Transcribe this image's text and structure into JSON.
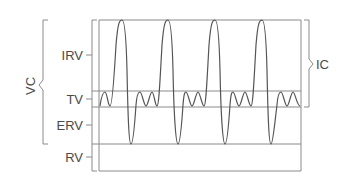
{
  "diagram": {
    "type": "lung-volumes-spirogram",
    "labels": {
      "vc": "VC",
      "ic": "IC",
      "irv": "IRV",
      "tv": "TV",
      "erv": "ERV",
      "rv": "RV"
    },
    "levels_y": {
      "top": 20,
      "tv_top": 91,
      "frc": 107,
      "rv_top": 144,
      "bottom": 171
    },
    "colors": {
      "line": "#8a8a8a",
      "wave": "#555555",
      "text": "#4a4a4a"
    }
  }
}
